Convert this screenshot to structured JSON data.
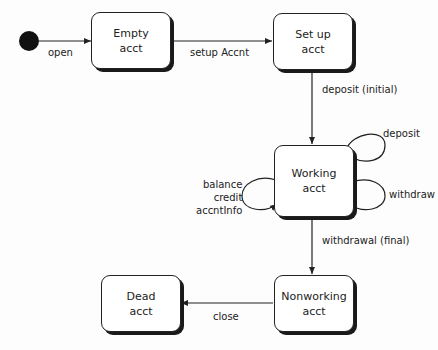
{
  "diagram": {
    "type": "state-diagram",
    "states": [
      {
        "id": "empty",
        "line1": "Empty",
        "line2": "acct"
      },
      {
        "id": "setup",
        "line1": "Set up",
        "line2": "acct"
      },
      {
        "id": "working",
        "line1": "Working",
        "line2": "acct"
      },
      {
        "id": "nonworking",
        "line1": "Nonworking",
        "line2": "acct"
      },
      {
        "id": "dead",
        "line1": "Dead",
        "line2": "acct"
      }
    ],
    "transitions": [
      {
        "from": "initial",
        "to": "empty",
        "label": "open"
      },
      {
        "from": "empty",
        "to": "setup",
        "label": "setup Accnt"
      },
      {
        "from": "setup",
        "to": "working",
        "label": "deposit (initial)"
      },
      {
        "from": "working",
        "to": "working",
        "label": "deposit"
      },
      {
        "from": "working",
        "to": "working",
        "label": "withdraw"
      },
      {
        "from": "working",
        "to": "working",
        "label_lines": [
          "balance",
          "credit",
          "accntInfo"
        ]
      },
      {
        "from": "working",
        "to": "nonworking",
        "label": "withdrawal (final)"
      },
      {
        "from": "nonworking",
        "to": "dead",
        "label": "close"
      }
    ]
  }
}
